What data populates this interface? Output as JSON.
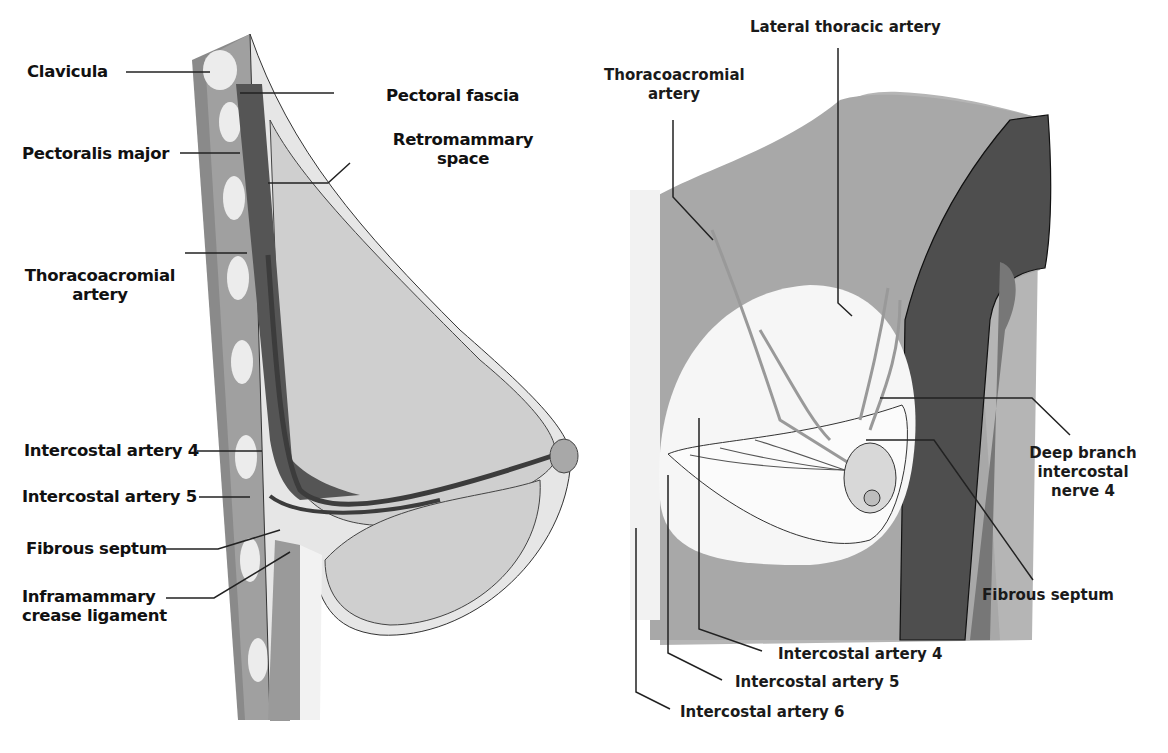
{
  "left_panel": {
    "view": "sagittal section",
    "labels": {
      "clavicula": "Clavicula",
      "pectoral_fascia": "Pectoral fascia",
      "pectoralis_major": "Pectoralis major",
      "retromammary_space_1": "Retromammary",
      "retromammary_space_2": "space",
      "thoracoacromial_1": "Thoracoacromial",
      "thoracoacromial_2": "artery",
      "intercostal_4": "Intercostal artery  4",
      "intercostal_5": "Intercostal artery  5",
      "fibrous_septum": "Fibrous septum",
      "inframammary_1": "Inframammary",
      "inframammary_2": "crease ligament"
    }
  },
  "right_panel": {
    "view": "frontal view",
    "labels": {
      "lateral_thoracic": "Lateral thoracic artery",
      "thoracoacromial_1": "Thoracoacromial",
      "thoracoacromial_2": "artery",
      "deep_branch_1": "Deep branch",
      "deep_branch_2": "intercostal",
      "deep_branch_3": "nerve  4",
      "fibrous_septum": "Fibrous septum",
      "intercostal_4": "Intercostal artery  4",
      "intercostal_5": "Intercostal artery  5",
      "intercostal_6": "Intercostal artery  6"
    }
  },
  "colors": {
    "skin": "#c8c8c8",
    "muscle_dark": "#5a5a5a",
    "gland": "#d4d4d4",
    "bone": "#eeeeee",
    "shoulder_dark": "#4e4e4e",
    "leader_line": "#222222"
  }
}
